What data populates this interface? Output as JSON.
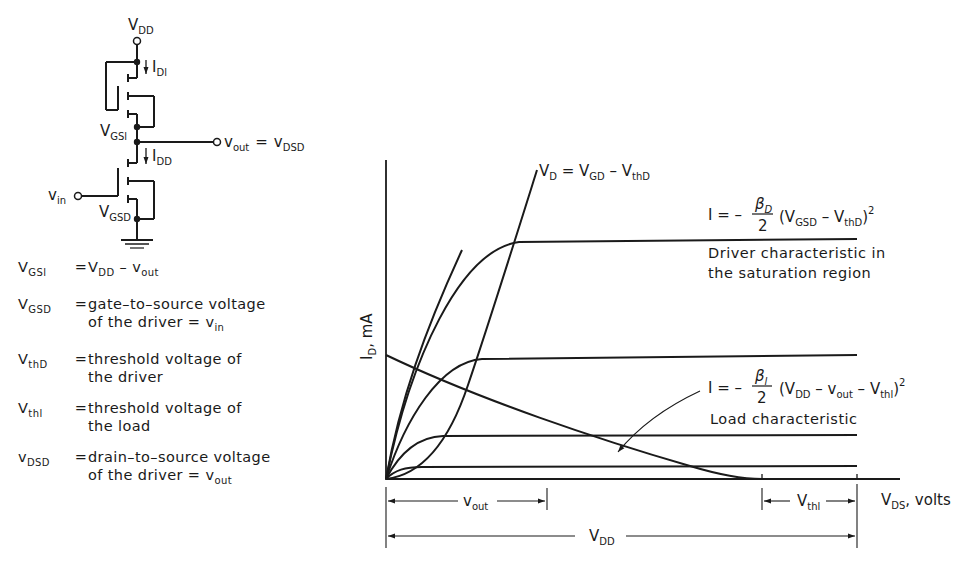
{
  "circuit": {
    "supply_label": "V",
    "supply_sub": "DD",
    "load_current_label": "I",
    "load_current_sub": "Dl",
    "load_vgs_label": "V",
    "load_vgs_sub": "GSl",
    "output_label": "v",
    "output_sub": "out",
    "output_eq": "=",
    "output_alt_label": "v",
    "output_alt_sub": "DSD",
    "driver_current_label": "I",
    "driver_current_sub": "DD",
    "input_label": "v",
    "input_sub": "in",
    "driver_vgs_label": "V",
    "driver_vgs_sub": "GSD",
    "ground_icon": "ground-symbol"
  },
  "definitions": [
    {
      "sym": "V",
      "sub": "GSl",
      "desc": "V",
      "desc_html": "V<sub>DD</sub> – v<sub>out</sub>"
    },
    {
      "sym": "V",
      "sub": "GSD",
      "desc_html": "gate–to–source voltage<br>of the driver = v<sub>in</sub>"
    },
    {
      "sym": "V",
      "sub": "thD",
      "desc_html": "threshold voltage of<br>the driver"
    },
    {
      "sym": "V",
      "sub": "thl",
      "desc_html": "threshold voltage of<br>the load"
    },
    {
      "sym": "v",
      "sub": "DSD",
      "desc_html": "drain–to–source voltage<br>of the driver = v<sub>out</sub>"
    }
  ],
  "chart_data": {
    "type": "line",
    "title": "",
    "xlabel": "V_DS, volts",
    "ylabel": "I_D, mA",
    "grid": false,
    "series": [
      {
        "name": "Driver characteristic V_GSD level 1 (highest)",
        "saturation_level": 4,
        "knee_x": 0.28
      },
      {
        "name": "Driver characteristic V_GSD level 2",
        "saturation_level": 2.6,
        "knee_x": 0.2
      },
      {
        "name": "Driver characteristic V_GSD level 3",
        "saturation_level": 1.0,
        "knee_x": 0.12
      },
      {
        "name": "Driver characteristic V_GSD level 4 (lowest)",
        "saturation_level": 0.3,
        "knee_x": 0.05
      },
      {
        "name": "Saturation boundary V_D = V_GD − V_thD",
        "type": "parabola"
      },
      {
        "name": "Load characteristic",
        "start_y": 2.5,
        "end_x": 0.79
      }
    ],
    "annotations": [
      {
        "text": "V_D = V_GD − V_thD",
        "target": "saturation boundary"
      },
      {
        "text": "I = −(β_D/2)(V_GSD − V_thD)²",
        "note": "Driver characteristic in the saturation region"
      },
      {
        "text": "I = −(β_l/2)(V_DD − v_out − V_thl)²",
        "note": "Load characteristic"
      },
      {
        "text": "v_out",
        "type": "dimension",
        "from": 0,
        "to": 0.33
      },
      {
        "text": "V_thl",
        "type": "dimension",
        "from": 0.79,
        "to": 1.0
      },
      {
        "text": "V_DD",
        "type": "dimension",
        "from": 0,
        "to": 1.0
      }
    ]
  },
  "graph": {
    "ylabel": "I",
    "ylabel_sub": "D",
    "ylabel_rest": ", mA",
    "xlabel": "V",
    "xlabel_sub": "DS",
    "xlabel_rest": ", volts",
    "boundary_label": "V",
    "boundary_sub1": "D",
    "boundary_mid": " = V",
    "boundary_sub2": "GD",
    "boundary_mid2": " – V",
    "boundary_sub3": "thD",
    "driver_eq_prefix": "I = –",
    "driver_eq_num": "β",
    "driver_eq_num_sub": "D",
    "driver_eq_den": "2",
    "driver_eq_paren": "(V",
    "driver_eq_s1": "GSD",
    "driver_eq_m": " – V",
    "driver_eq_s2": "thD",
    "driver_eq_close": ")",
    "driver_eq_exp": "2",
    "driver_note_1": "Driver characteristic in",
    "driver_note_2": "the saturation region",
    "load_eq_prefix": "I = –",
    "load_eq_num": "β",
    "load_eq_num_sub": "l",
    "load_eq_den": "2",
    "load_eq_paren": "(V",
    "load_eq_s1": "DD",
    "load_eq_m1": " – v",
    "load_eq_s2": "out",
    "load_eq_m2": " – V",
    "load_eq_s3": "thl",
    "load_eq_close": ")",
    "load_eq_exp": "2",
    "load_note": "Load characteristic",
    "dim_vout": "v",
    "dim_vout_sub": "out",
    "dim_vthl": "V",
    "dim_vthl_sub": "thl",
    "dim_vdd": "V",
    "dim_vdd_sub": "DD"
  }
}
